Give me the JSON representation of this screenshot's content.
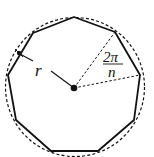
{
  "diagram": {
    "labels": {
      "radius": "r",
      "angle_numerator": "2π",
      "angle_denominator": "n"
    },
    "polygon_sides": 9,
    "colors": {
      "stroke": "#111111",
      "background": "#ffffff"
    }
  }
}
